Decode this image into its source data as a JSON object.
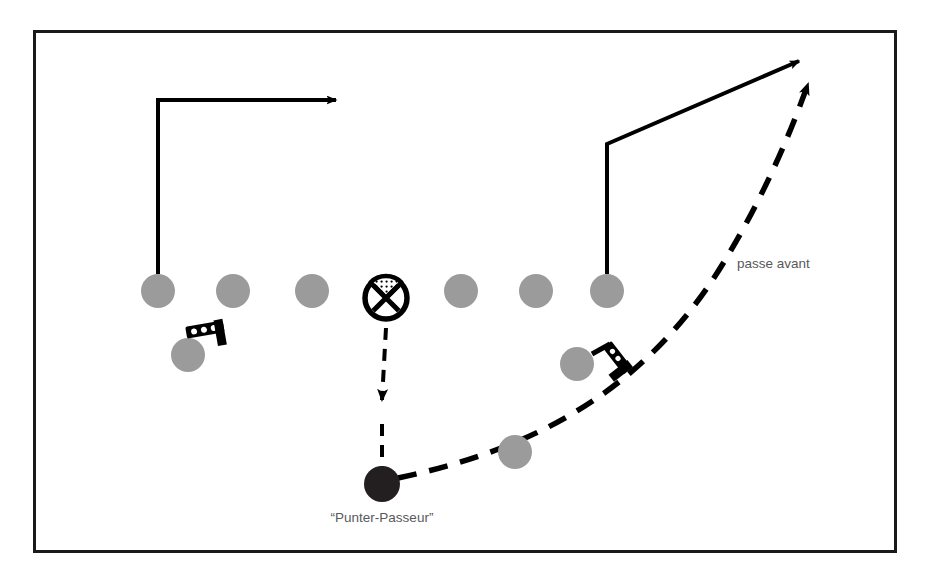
{
  "diagram": {
    "type": "american-football-play-diagram",
    "frame": {
      "x": 33,
      "y": 30,
      "width": 864,
      "height": 523,
      "border_color": "#1a1a1a",
      "border_width": 3,
      "background_color": "#ffffff"
    },
    "colors": {
      "player_gray": "#9b9b9b",
      "ball_carrier_dark": "#231f20",
      "line_black": "#000000",
      "label_text": "#58595b",
      "page_background": "#ffffff"
    },
    "labels": [
      {
        "id": "punter-passeur-label",
        "text": "“Punter-Passeur”",
        "x": 382,
        "y": 522,
        "anchor": "middle",
        "font_size": 13
      },
      {
        "id": "passe-avant-label",
        "text": "passe avant",
        "x": 737,
        "y": 268,
        "anchor": "start",
        "font_size": 13
      }
    ],
    "players": {
      "line_of_scrimmage": [
        {
          "id": "lineman-1",
          "role": "receiver-left-end",
          "x": 158,
          "y": 291,
          "r": 17,
          "fill": "player_gray"
        },
        {
          "id": "lineman-2",
          "role": "lineman",
          "x": 233,
          "y": 291,
          "r": 17,
          "fill": "player_gray"
        },
        {
          "id": "lineman-3",
          "role": "lineman",
          "x": 312,
          "y": 291,
          "r": 17,
          "fill": "player_gray"
        },
        {
          "id": "center-snapper",
          "role": "center",
          "x": 386,
          "y": 298,
          "r": 25,
          "fill": "center-marker"
        },
        {
          "id": "lineman-4",
          "role": "lineman",
          "x": 461,
          "y": 291,
          "r": 17,
          "fill": "player_gray"
        },
        {
          "id": "lineman-5",
          "role": "lineman",
          "x": 536,
          "y": 291,
          "r": 17,
          "fill": "player_gray"
        },
        {
          "id": "lineman-6",
          "role": "receiver-right-end",
          "x": 607,
          "y": 291,
          "r": 17,
          "fill": "player_gray"
        }
      ],
      "backfield": [
        {
          "id": "back-left-blocker",
          "role": "blocker-left",
          "x": 188,
          "y": 355,
          "r": 17,
          "fill": "player_gray"
        },
        {
          "id": "back-right-blocker",
          "role": "blocker-right",
          "x": 577,
          "y": 364,
          "r": 17,
          "fill": "player_gray"
        },
        {
          "id": "back-protector",
          "role": "protector",
          "x": 515,
          "y": 452,
          "r": 17,
          "fill": "player_gray"
        },
        {
          "id": "punter-passeur",
          "role": "punter-passer",
          "x": 382,
          "y": 484,
          "r": 18,
          "fill": "ball_carrier_dark"
        }
      ]
    },
    "routes": [
      {
        "id": "route-left-out",
        "style": "solid",
        "description": "tracé vertical puis sortie vers la droite",
        "points": "158,274 158,100 333,100",
        "arrow": {
          "x": 348,
          "y": 100,
          "direction": "right"
        }
      },
      {
        "id": "route-right-corner",
        "style": "solid",
        "description": "tracé vertical puis diagonale vers le coin",
        "points": "607,274 607,144 797,62",
        "arrow": {
          "x": 811,
          "y": 56,
          "direction": "up-right"
        }
      }
    ],
    "ball_paths": [
      {
        "id": "snap-path",
        "style": "dashed",
        "description": "remise longue du centre au punter",
        "points": "386,326 382,400",
        "arrow": {
          "x": 382,
          "y": 414,
          "direction": "down"
        }
      },
      {
        "id": "forward-pass-path",
        "style": "dashed",
        "description": "passe avant vers le receveur de droite",
        "curve": "M 400,478 Q 620,430 770,120",
        "arrow": {
          "x": 820,
          "y": 60,
          "direction": "up-right"
        },
        "label": "passe avant"
      }
    ],
    "markers": [
      {
        "id": "blocker-marker-left",
        "type": "blocking-marker",
        "x": 205,
        "y": 330,
        "rotation": -12
      },
      {
        "id": "blocker-marker-right",
        "type": "blocking-marker",
        "x": 617,
        "y": 358,
        "rotation": 55
      }
    ],
    "center_marker": {
      "id": "center-x-circle",
      "outer_radius": 24,
      "stroke_width": 5,
      "description": "cercle avec X et zone hachurée supérieure"
    }
  }
}
